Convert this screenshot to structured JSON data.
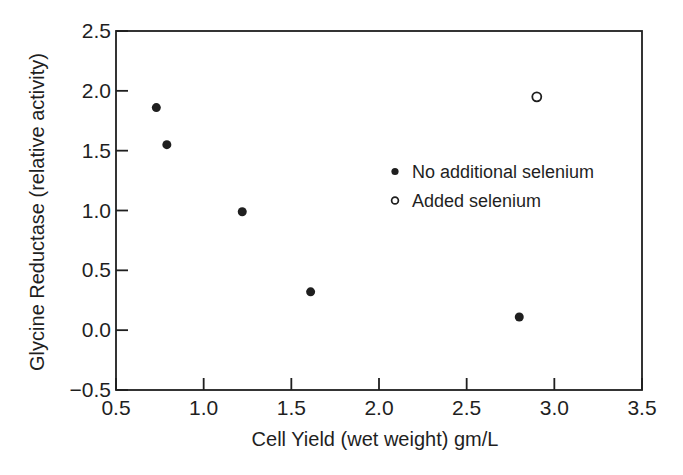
{
  "colors": {
    "ink": "#1f1f1f",
    "background": "#ffffff"
  },
  "chart_data": {
    "type": "scatter",
    "title": "",
    "xlabel": "Cell Yield (wet weight) gm/L",
    "ylabel": "Glycine Reductase (relative activity)",
    "xlim": [
      0.5,
      3.5
    ],
    "ylim": [
      -0.5,
      2.5
    ],
    "x_ticks": [
      0.5,
      1.0,
      1.5,
      2.0,
      2.5,
      3.0,
      3.5
    ],
    "y_ticks": [
      -0.5,
      0.0,
      0.5,
      1.0,
      1.5,
      2.0,
      2.5
    ],
    "x_tick_labels": [
      "0.5",
      "1.0",
      "1.5",
      "2.0",
      "2.5",
      "3.0",
      "3.5"
    ],
    "y_tick_labels": [
      "−0.5",
      "0.0",
      "0.5",
      "1.0",
      "1.5",
      "2.0",
      "2.5"
    ],
    "grid": false,
    "legend_position": "inside-right",
    "series": [
      {
        "name": "No additional selenium",
        "marker": "filled-circle",
        "points": [
          [
            0.73,
            1.86
          ],
          [
            0.79,
            1.55
          ],
          [
            1.22,
            0.99
          ],
          [
            1.61,
            0.32
          ],
          [
            2.8,
            0.11
          ]
        ]
      },
      {
        "name": "Added selenium",
        "marker": "open-circle",
        "points": [
          [
            2.9,
            1.95
          ]
        ]
      }
    ]
  }
}
